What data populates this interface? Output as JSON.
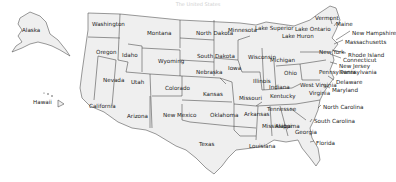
{
  "title": "The United States",
  "colors": {
    "land": "#efefef",
    "border": "#555555",
    "text": "#222222",
    "background": "#ffffff"
  },
  "states": [
    {
      "name": "Alaska",
      "x": 22,
      "y": 28
    },
    {
      "name": "Hawaii",
      "x": 33,
      "y": 100
    },
    {
      "name": "Washington",
      "x": 92,
      "y": 22
    },
    {
      "name": "Oregon",
      "x": 96,
      "y": 50
    },
    {
      "name": "California",
      "x": 89,
      "y": 104
    },
    {
      "name": "Nevada",
      "x": 103,
      "y": 78
    },
    {
      "name": "Idaho",
      "x": 122,
      "y": 53
    },
    {
      "name": "Montana",
      "x": 147,
      "y": 31
    },
    {
      "name": "Wyoming",
      "x": 158,
      "y": 59
    },
    {
      "name": "Utah",
      "x": 131,
      "y": 80
    },
    {
      "name": "Colorado",
      "x": 165,
      "y": 86
    },
    {
      "name": "Arizona",
      "x": 127,
      "y": 114
    },
    {
      "name": "New Mexico",
      "x": 163,
      "y": 113
    },
    {
      "name": "North Dakota",
      "x": 196,
      "y": 31
    },
    {
      "name": "South Dakota",
      "x": 197,
      "y": 54
    },
    {
      "name": "Nebraska",
      "x": 196,
      "y": 70
    },
    {
      "name": "Kansas",
      "x": 203,
      "y": 92
    },
    {
      "name": "Oklahoma",
      "x": 210,
      "y": 113
    },
    {
      "name": "Texas",
      "x": 199,
      "y": 142
    },
    {
      "name": "Minnesota",
      "x": 228,
      "y": 28
    },
    {
      "name": "Iowa",
      "x": 228,
      "y": 66
    },
    {
      "name": "Missouri",
      "x": 239,
      "y": 96
    },
    {
      "name": "Arkansas",
      "x": 244,
      "y": 112
    },
    {
      "name": "Louisiana",
      "x": 249,
      "y": 144
    },
    {
      "name": "Wisconsin",
      "x": 248,
      "y": 55
    },
    {
      "name": "Illinois",
      "x": 253,
      "y": 79
    },
    {
      "name": "Michigan",
      "x": 270,
      "y": 58
    },
    {
      "name": "Indiana",
      "x": 269,
      "y": 85
    },
    {
      "name": "Ohio",
      "x": 284,
      "y": 71
    },
    {
      "name": "Kentucky",
      "x": 270,
      "y": 94
    },
    {
      "name": "Tennessee",
      "x": 267,
      "y": 107
    },
    {
      "name": "Mississippi",
      "x": 262,
      "y": 124
    },
    {
      "name": "Alabama",
      "x": 275,
      "y": 124
    },
    {
      "name": "Georgia",
      "x": 295,
      "y": 130
    },
    {
      "name": "West Virginia",
      "x": 300,
      "y": 83
    },
    {
      "name": "Virginia",
      "x": 309,
      "y": 91
    },
    {
      "name": "New York",
      "x": 319,
      "y": 50
    },
    {
      "name": "Pennsylvania",
      "x": 319,
      "y": 70
    }
  ],
  "callouts": [
    {
      "name": "Lake Superior",
      "x": 255,
      "y": 26
    },
    {
      "name": "Lake Huron",
      "x": 282,
      "y": 34
    },
    {
      "name": "Lake Ontario",
      "x": 295,
      "y": 27
    },
    {
      "name": "Vermont",
      "x": 315,
      "y": 16
    },
    {
      "name": "Maine",
      "x": 336,
      "y": 22
    },
    {
      "name": "New Hampshire",
      "x": 352,
      "y": 31
    },
    {
      "name": "Massachusetts",
      "x": 345,
      "y": 40
    },
    {
      "name": "Rhode Island",
      "x": 348,
      "y": 53
    },
    {
      "name": "Connecticut",
      "x": 343,
      "y": 58
    },
    {
      "name": "New Jersey",
      "x": 339,
      "y": 64
    },
    {
      "name": "Pennsylvania",
      "x": 340,
      "y": 70
    },
    {
      "name": "Delaware",
      "x": 336,
      "y": 80
    },
    {
      "name": "Maryland",
      "x": 332,
      "y": 88
    },
    {
      "name": "North Carolina",
      "x": 323,
      "y": 105
    },
    {
      "name": "South Carolina",
      "x": 314,
      "y": 119
    },
    {
      "name": "Florida",
      "x": 316,
      "y": 141
    }
  ]
}
